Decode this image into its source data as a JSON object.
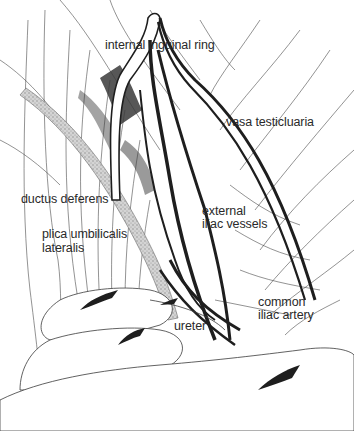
{
  "figure": {
    "type": "anatomical line drawing"
  },
  "labels": {
    "internal_inguinal_ring": "internal inguinal ring",
    "vasa_testicularia": "vasa testicluaria",
    "ductus_deferens": "ductus deferens",
    "external_iliac_vessels_1": "external",
    "external_iliac_vessels_2": "iliac vessels",
    "plica_1": "plica umbilicalis",
    "plica_2": "lateralis",
    "common_iliac_1": "common",
    "common_iliac_2": "iliac artery",
    "ureter": "ureter"
  },
  "colors": {
    "line": "#3a3a3a",
    "vessel": "#1e1e1e",
    "shading": "#555555",
    "band": "#b0b0b0",
    "background": "#ffffff"
  }
}
